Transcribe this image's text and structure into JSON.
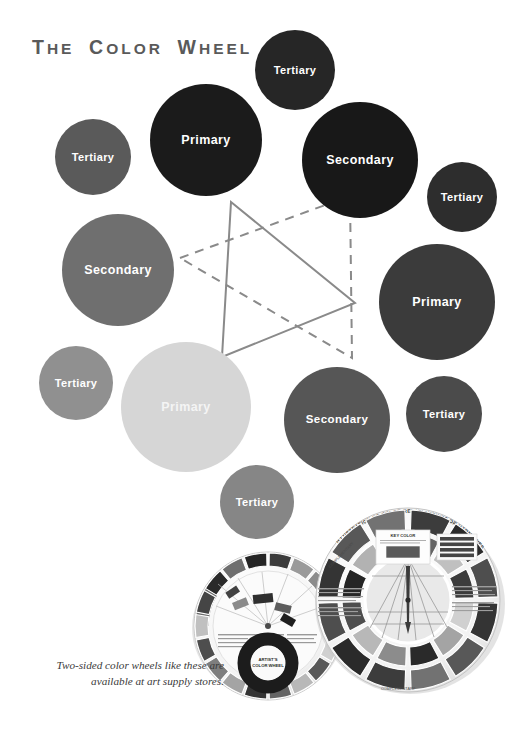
{
  "page": {
    "background": "#ffffff"
  },
  "caption": {
    "line1": "Two-sided color wheels like these are",
    "line2": "available at art supply stores."
  },
  "labels": {
    "primary": "Primary",
    "secondary": "Secondary",
    "tertiary": "Tertiary"
  },
  "diagram": {
    "star": {
      "solid_triangle_points": "231,202 355,303 222,357",
      "dashed_triangle_points": "180,258 350,196 352,358",
      "stroke_color": "#8a8a8a",
      "stroke_width": 2,
      "dash_pattern": "9,7"
    },
    "circles": [
      {
        "label": "Tertiary",
        "cx": 295,
        "cy": 70,
        "r": 40,
        "color": "#262626",
        "size": "sm"
      },
      {
        "label": "Primary",
        "cx": 206,
        "cy": 140,
        "r": 56,
        "color": "#1b1b1b",
        "size": "lg"
      },
      {
        "label": "Tertiary",
        "cx": 93,
        "cy": 157,
        "r": 38,
        "color": "#5a5a5a",
        "size": "sm"
      },
      {
        "label": "Secondary",
        "cx": 360,
        "cy": 160,
        "r": 58,
        "color": "#181818",
        "size": "lg"
      },
      {
        "label": "Tertiary",
        "cx": 462,
        "cy": 197,
        "r": 35,
        "color": "#2d2d2d",
        "size": "sm"
      },
      {
        "label": "Secondary",
        "cx": 118,
        "cy": 270,
        "r": 56,
        "color": "#6f6f6f",
        "size": "lg"
      },
      {
        "label": "Primary",
        "cx": 437,
        "cy": 302,
        "r": 58,
        "color": "#3b3b3b",
        "size": "lg"
      },
      {
        "label": "Tertiary",
        "cx": 76,
        "cy": 383,
        "r": 37,
        "color": "#909090",
        "size": "sm"
      },
      {
        "label": "Primary",
        "cx": 186,
        "cy": 407,
        "r": 65,
        "color": "#d6d6d6",
        "size": "lg",
        "textColor": "#f4f4f4"
      },
      {
        "label": "Secondary",
        "cx": 337,
        "cy": 420,
        "r": 53,
        "color": "#565656",
        "size": "md"
      },
      {
        "label": "Tertiary",
        "cx": 444,
        "cy": 414,
        "r": 38,
        "color": "#4b4b4b",
        "size": "sm"
      },
      {
        "label": "Tertiary",
        "cx": 257,
        "cy": 502,
        "r": 37,
        "color": "#868686",
        "size": "sm"
      }
    ]
  },
  "photos": {
    "right_wheel": {
      "name": "color-relationships-wheel-photo",
      "heading": "ILLUSTRATION OF COLOR RELATIONSHIPS OR HARMONIES",
      "sub": "KEY COLOR"
    },
    "left_wheel": {
      "name": "artists-color-wheel-photo",
      "heading": "ARTIST'S COLOR WHEEL"
    }
  }
}
